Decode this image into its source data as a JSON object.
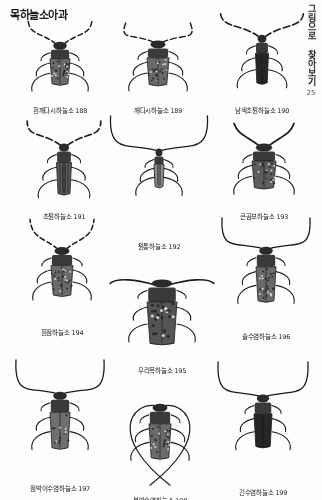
{
  "page": {
    "title": "목하늘소아과",
    "side_tab_text": "그림으로 찾아보기",
    "page_number": "25",
    "background_color": "#fdfdfd",
    "ink_color": "#1c1c1c"
  },
  "specimens": [
    {
      "id": "s188",
      "name": "흰깨다시하늘소",
      "number": "188",
      "caption": "흰깨다시하늘소 188",
      "row": 1,
      "col": 1,
      "x": 12,
      "y": 18,
      "w": 96,
      "h": 86,
      "body_w": 20,
      "body_h": 34,
      "antenna": "splayed-short",
      "pattern": "mottled"
    },
    {
      "id": "s189",
      "name": "깨다시하늘소",
      "number": "189",
      "caption": "깨다시하늘소 189",
      "row": 1,
      "col": 2,
      "x": 112,
      "y": 16,
      "w": 92,
      "h": 88,
      "body_w": 22,
      "body_h": 36,
      "antenna": "curved-wide",
      "pattern": "mottled"
    },
    {
      "id": "s190",
      "name": "남색초원하늘소",
      "number": "190",
      "caption": "남색초원하늘소 190",
      "row": 1,
      "col": 3,
      "x": 210,
      "y": 8,
      "w": 104,
      "h": 96,
      "body_w": 13,
      "body_h": 40,
      "antenna": "long-banded",
      "pattern": "dark-solid"
    },
    {
      "id": "s191",
      "name": "초원하늘소",
      "number": "191",
      "caption": "초원하늘소 191",
      "row": 2,
      "col": 1,
      "x": 18,
      "y": 118,
      "w": 92,
      "h": 92,
      "body_w": 15,
      "body_h": 42,
      "antenna": "long-banded",
      "pattern": "striped"
    },
    {
      "id": "s192",
      "name": "원통하늘소",
      "number": "192",
      "caption": "원통하늘소 192",
      "row": 2,
      "col": 2,
      "x": 104,
      "y": 112,
      "w": 110,
      "h": 128,
      "body_w": 10,
      "body_h": 30,
      "antenna": "very-long-arc",
      "pattern": "slim-pale"
    },
    {
      "id": "s193",
      "name": "큰곰보하늘소",
      "number": "193",
      "caption": "큰곰보하늘소 193",
      "row": 2,
      "col": 3,
      "x": 216,
      "y": 118,
      "w": 96,
      "h": 92,
      "body_w": 24,
      "body_h": 36,
      "antenna": "short-thick",
      "pattern": "rough-mottled"
    },
    {
      "id": "s194",
      "name": "흰점하늘소",
      "number": "194",
      "caption": "흰점하늘소 194",
      "row": 3,
      "col": 1,
      "x": 14,
      "y": 216,
      "w": 96,
      "h": 110,
      "body_w": 22,
      "body_h": 40,
      "antenna": "splayed-short",
      "pattern": "mottled"
    },
    {
      "id": "s195",
      "name": "우리목하늘소",
      "number": "195",
      "caption": "우리목하늘소 195",
      "row": 3,
      "col": 2,
      "x": 108,
      "y": 246,
      "w": 108,
      "h": 118,
      "body_w": 30,
      "body_h": 56,
      "antenna": "horizontal-wide",
      "pattern": "bold-mottled"
    },
    {
      "id": "s196",
      "name": "솔수염하늘소",
      "number": "196",
      "caption": "솔수염하늘소 196",
      "row": 3,
      "col": 3,
      "x": 216,
      "y": 214,
      "w": 100,
      "h": 116,
      "body_w": 20,
      "body_h": 46,
      "antenna": "very-long-arc",
      "pattern": "mottled"
    },
    {
      "id": "s197",
      "name": "점박이수염하늘소",
      "number": "197",
      "caption": "점박이수염하늘소 197",
      "row": 4,
      "col": 1,
      "x": 10,
      "y": 356,
      "w": 100,
      "h": 126,
      "body_w": 20,
      "body_h": 48,
      "antenna": "very-long-arc",
      "pattern": "spotted"
    },
    {
      "id": "s198",
      "name": "북방수염하늘소",
      "number": "198",
      "caption": "북방수염하늘소 198",
      "row": 4,
      "col": 2,
      "x": 106,
      "y": 368,
      "w": 108,
      "h": 126,
      "body_w": 22,
      "body_h": 46,
      "antenna": "very-long-crossed",
      "pattern": "mottled"
    },
    {
      "id": "s199",
      "name": "긴수염하늘소",
      "number": "199",
      "caption": "긴수염하늘소 199",
      "row": 4,
      "col": 3,
      "x": 212,
      "y": 358,
      "w": 102,
      "h": 128,
      "body_w": 18,
      "body_h": 44,
      "antenna": "very-long-arc",
      "pattern": "dark-solid"
    }
  ]
}
